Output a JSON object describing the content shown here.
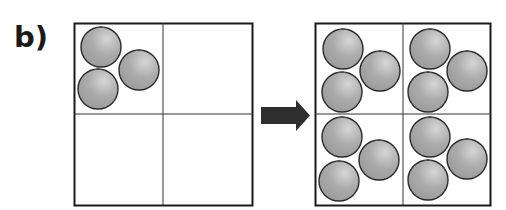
{
  "label": "b)",
  "colors": {
    "grid_line": "#1a1a1a",
    "orange_fill": "#a8a8a8",
    "orange_highlight": "#d0d0d0",
    "orange_stroke": "#2a2a2a",
    "arrow": "#2e2e2e"
  },
  "left_grid": {
    "cells": [
      {
        "position": "top-left",
        "orange_count": 3
      },
      {
        "position": "top-right",
        "orange_count": 0
      },
      {
        "position": "bottom-left",
        "orange_count": 0
      },
      {
        "position": "bottom-right",
        "orange_count": 0
      }
    ]
  },
  "arrow": {
    "direction": "right"
  },
  "right_grid": {
    "cells": [
      {
        "position": "top-left",
        "orange_count": 3
      },
      {
        "position": "top-right",
        "orange_count": 3
      },
      {
        "position": "bottom-left",
        "orange_count": 3
      },
      {
        "position": "bottom-right",
        "orange_count": 3
      }
    ]
  }
}
